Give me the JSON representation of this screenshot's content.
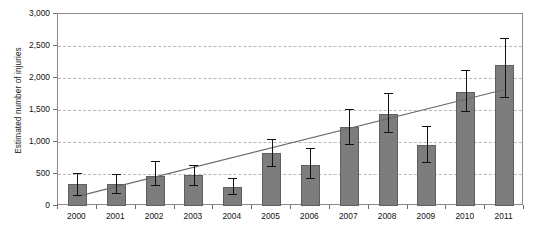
{
  "chart_data": {
    "type": "bar",
    "title": "",
    "xlabel": "",
    "ylabel": "Estimated number of injuries",
    "categories": [
      "2000",
      "2001",
      "2002",
      "2003",
      "2004",
      "2005",
      "2006",
      "2007",
      "2008",
      "2009",
      "2010",
      "2011"
    ],
    "values": [
      350,
      340,
      470,
      490,
      290,
      830,
      640,
      1230,
      1440,
      950,
      1780,
      2200
    ],
    "error_low": [
      170,
      200,
      330,
      330,
      180,
      620,
      440,
      970,
      1150,
      690,
      1480,
      1700
    ],
    "error_high": [
      520,
      500,
      700,
      640,
      430,
      1050,
      900,
      1520,
      1760,
      1250,
      2130,
      2620
    ],
    "ylim": [
      0,
      3000
    ],
    "yticks": [
      0,
      500,
      1000,
      1500,
      2000,
      2500,
      3000
    ],
    "ytick_labels": [
      "0",
      "500",
      "1,000",
      "1,500",
      "2,000",
      "2,500",
      "3,000"
    ],
    "grid": true,
    "legend": "none",
    "series": [
      {
        "name": "Estimated number of injuries",
        "values": [
          350,
          340,
          470,
          490,
          290,
          830,
          640,
          1230,
          1440,
          950,
          1780,
          2200
        ],
        "type": "bar",
        "color": "#7d7d7d"
      },
      {
        "name": "Linear trend",
        "type": "line",
        "color": "#6b6b6b",
        "start_value": 150,
        "end_value": 1820
      }
    ],
    "bar_color": "#7d7d7d",
    "trendline_color": "#6b6b6b",
    "errorbar_color": "#111111",
    "gridline_color": "#b9b9b9",
    "axis_color": "#8c8c8c"
  }
}
